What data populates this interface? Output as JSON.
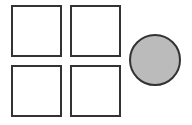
{
  "diagram": {
    "squares": [
      {
        "id": "top-left",
        "x": 11,
        "y": 5,
        "w": 50,
        "h": 51
      },
      {
        "id": "top-right",
        "x": 70,
        "y": 5,
        "w": 50,
        "h": 51
      },
      {
        "id": "bottom-left",
        "x": 11,
        "y": 65,
        "w": 50,
        "h": 51
      },
      {
        "id": "bottom-right",
        "x": 70,
        "y": 65,
        "w": 50,
        "h": 51
      }
    ],
    "circle": {
      "cx": 155,
      "cy": 60,
      "r": 26,
      "fill": "#bbbbbb"
    },
    "stroke_color": "#333333",
    "square_fill": "#ffffff"
  }
}
